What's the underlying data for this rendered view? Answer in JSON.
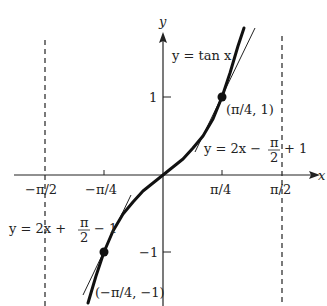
{
  "figure": {
    "curve_label": "y = tan x",
    "axes": {
      "x_label": "x",
      "y_label": "y"
    },
    "x_ticks": [
      "−π/2",
      "−π/4",
      "π/4",
      "π/2"
    ],
    "y_ticks": [
      "1",
      "−1"
    ],
    "points": [
      {
        "label": "(π/4, 1)",
        "x": 0.7854,
        "y": 1
      },
      {
        "label": "(−π/4, −1)",
        "x": -0.7854,
        "y": -1
      }
    ],
    "tangent_upper": {
      "prefix": "y = 2x −",
      "frac_num": "π",
      "frac_den": "2",
      "suffix": "+ 1"
    },
    "tangent_lower": {
      "prefix": "y = 2x +",
      "frac_num": "π",
      "frac_den": "2",
      "suffix": "− 1"
    },
    "asymptotes": [
      "x = −π/2",
      "x = π/2"
    ],
    "colors": {
      "curve": "#111111",
      "axis": "#222222",
      "asymptote": "#333333"
    }
  }
}
